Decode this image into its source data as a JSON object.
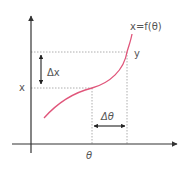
{
  "diagram": {
    "curve_label": "x=f(θ)",
    "curve_color": "#e0557a",
    "axis_color": "#333333",
    "guide_color": "#888888",
    "labels": {
      "y_point": "y",
      "x_point": "x",
      "theta_point": "θ",
      "delta_x": "Δx",
      "delta_theta": "Δθ"
    }
  }
}
